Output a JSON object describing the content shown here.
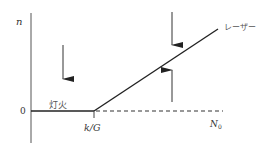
{
  "diagram": {
    "type": "laser-threshold-diagram",
    "y_axis_label": "n",
    "zero_label": "0",
    "threshold_label": "k/G",
    "x_axis_label": "N",
    "x_axis_subscript": "0",
    "region_below_label": "灯火",
    "region_above_label": "レーザー",
    "colors": {
      "line": "#222222",
      "axis": "#444444",
      "dashed": "#333333",
      "text": "#333333"
    }
  }
}
